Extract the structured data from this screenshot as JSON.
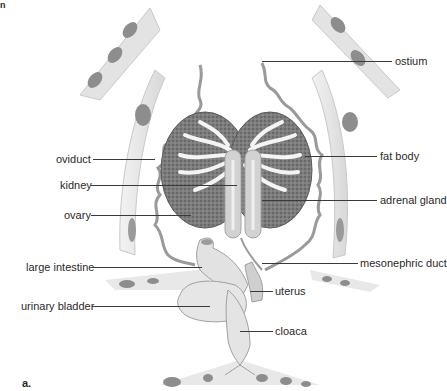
{
  "figure": {
    "panel_letter": "a.",
    "corner_mark": "n",
    "colors": {
      "tissue": "#e6e6e6",
      "tissue_edge": "#bdbdbd",
      "dark_lobe": "#8a8a8a",
      "kidney_texture": "#6f6f6f",
      "label_text": "#2a2a2a",
      "leader_line": "#3a3a3a"
    },
    "labels_left": [
      {
        "text": "oviduct",
        "target": "oviduct"
      },
      {
        "text": "kidney",
        "target": "kidney"
      },
      {
        "text": "ovary",
        "target": "ovary"
      },
      {
        "text": "large intestine",
        "target": "large-intestine"
      },
      {
        "text": "urinary bladder",
        "target": "urinary-bladder"
      }
    ],
    "labels_right": [
      {
        "text": "ostium",
        "target": "ostium"
      },
      {
        "text": "fat body",
        "target": "fat-body"
      },
      {
        "text": "adrenal gland",
        "target": "adrenal-gland"
      },
      {
        "text": "mesonephric duct",
        "target": "mesonephric-duct"
      },
      {
        "text": "uterus",
        "target": "uterus"
      },
      {
        "text": "cloaca",
        "target": "cloaca"
      }
    ]
  }
}
